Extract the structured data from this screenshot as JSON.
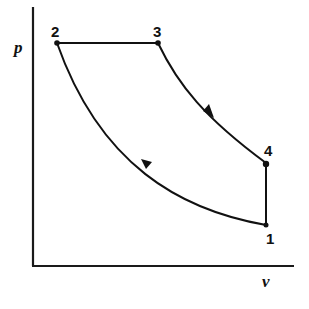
{
  "diagram": {
    "type": "p-v thermodynamic cycle diagram",
    "axes": {
      "y_label": "p",
      "x_label": "v"
    },
    "states": [
      {
        "id": "1",
        "label": "1"
      },
      {
        "id": "2",
        "label": "2"
      },
      {
        "id": "3",
        "label": "3"
      },
      {
        "id": "4",
        "label": "4"
      }
    ],
    "processes": [
      {
        "from": "1",
        "to": "2",
        "shape": "curve",
        "arrow_direction": "up-left"
      },
      {
        "from": "2",
        "to": "3",
        "shape": "horizontal line (constant pressure)"
      },
      {
        "from": "3",
        "to": "4",
        "shape": "curve",
        "arrow_direction": "down-right"
      },
      {
        "from": "4",
        "to": "1",
        "shape": "vertical line (constant volume)"
      }
    ],
    "colors": {
      "line": "#111111",
      "background": "#ffffff"
    }
  }
}
